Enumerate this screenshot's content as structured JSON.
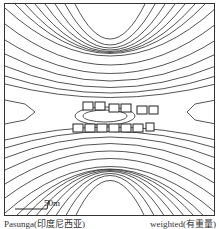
{
  "figure": {
    "type": "contour-plot",
    "scale_bar_label": "50m",
    "caption_left": "Pasunga(印度尼西亚)",
    "caption_right": "weighted(有重量)",
    "colors": {
      "line": "#222222",
      "background": "#ffffff",
      "buildings": "#333333"
    }
  }
}
